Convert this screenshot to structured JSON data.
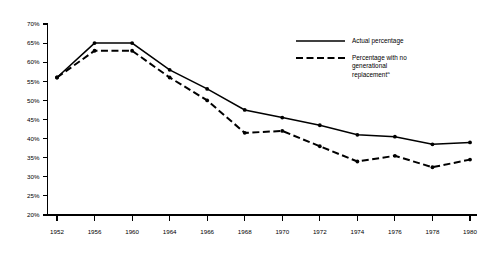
{
  "chart_data": {
    "type": "line",
    "title": "",
    "subtitle": "",
    "xlabel": "",
    "ylabel": "",
    "grid": false,
    "legend_position": "top-right",
    "x": [
      1952,
      1956,
      1960,
      1964,
      1966,
      1968,
      1970,
      1972,
      1974,
      1976,
      1978,
      1980
    ],
    "categories": [
      "1952",
      "1956",
      "1960",
      "1964",
      "1966",
      "1968",
      "1970",
      "1972",
      "1974",
      "1976",
      "1978",
      "1980"
    ],
    "xlim": [
      1952,
      1980
    ],
    "ylim": [
      20,
      70
    ],
    "ytick_values": [
      20,
      25,
      30,
      35,
      40,
      45,
      50,
      55,
      60,
      65,
      70
    ],
    "ytick_labels": [
      "20%",
      "25%",
      "30%",
      "35%",
      "40%",
      "45%",
      "50%",
      "55%",
      "60%",
      "65%",
      "70%"
    ],
    "series": [
      {
        "name": "Actual percentage",
        "style": "solid",
        "color": "#000000",
        "values": [
          56,
          65,
          65,
          58,
          53,
          47.5,
          45.5,
          43.5,
          41,
          40.5,
          38.5,
          39
        ]
      },
      {
        "name": "Percentage with no generational replacement",
        "style": "dashed",
        "color": "#000000",
        "footnote_marker": "a",
        "values": [
          56,
          63,
          63,
          56,
          50,
          41.5,
          42,
          38,
          34,
          35.5,
          32.5,
          34.5
        ]
      }
    ]
  },
  "legend": {
    "entries": [
      {
        "label": "Actual percentage",
        "line2": "",
        "line3": "",
        "marker": ""
      },
      {
        "label": "Percentage with no",
        "line2": "generational",
        "line3": "replacement",
        "marker": "a"
      }
    ]
  },
  "colors": {
    "ink": "#000000",
    "background": "#ffffff"
  }
}
